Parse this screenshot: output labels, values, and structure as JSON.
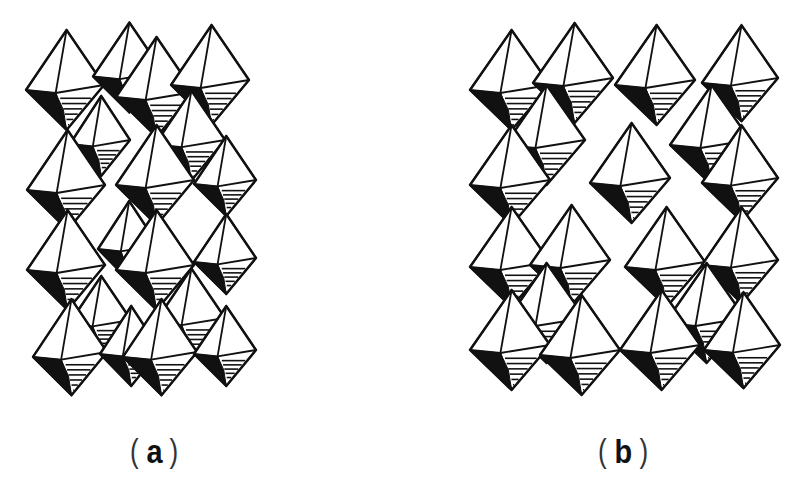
{
  "figure": {
    "background": "#ffffff",
    "ink": "#111111",
    "panels": [
      {
        "id": "a",
        "label": "a",
        "paren_open": "(",
        "paren_close": ")",
        "label_x": 130,
        "description": "Densely packed corner/edge-sharing octahedra",
        "octahedra": [
          {
            "cx": 65,
            "cy": 85,
            "w": 78,
            "h": 100
          },
          {
            "cx": 128,
            "cy": 72,
            "w": 70,
            "h": 90
          },
          {
            "cx": 155,
            "cy": 92,
            "w": 78,
            "h": 100
          },
          {
            "cx": 210,
            "cy": 80,
            "w": 78,
            "h": 100
          },
          {
            "cx": 100,
            "cy": 140,
            "w": 60,
            "h": 80
          },
          {
            "cx": 190,
            "cy": 140,
            "w": 70,
            "h": 90
          },
          {
            "cx": 66,
            "cy": 185,
            "w": 78,
            "h": 100
          },
          {
            "cx": 155,
            "cy": 180,
            "w": 78,
            "h": 100
          },
          {
            "cx": 225,
            "cy": 180,
            "w": 62,
            "h": 80
          },
          {
            "cx": 66,
            "cy": 265,
            "w": 78,
            "h": 100
          },
          {
            "cx": 128,
            "cy": 245,
            "w": 60,
            "h": 80
          },
          {
            "cx": 155,
            "cy": 265,
            "w": 78,
            "h": 100
          },
          {
            "cx": 225,
            "cy": 258,
            "w": 62,
            "h": 80
          },
          {
            "cx": 100,
            "cy": 320,
            "w": 62,
            "h": 80
          },
          {
            "cx": 190,
            "cy": 318,
            "w": 70,
            "h": 90
          },
          {
            "cx": 70,
            "cy": 352,
            "w": 74,
            "h": 96
          },
          {
            "cx": 130,
            "cy": 350,
            "w": 60,
            "h": 80
          },
          {
            "cx": 160,
            "cy": 352,
            "w": 74,
            "h": 96
          },
          {
            "cx": 225,
            "cy": 350,
            "w": 62,
            "h": 80
          }
        ]
      },
      {
        "id": "b",
        "label": "b",
        "paren_open": "(",
        "paren_close": ")",
        "label_x": 598,
        "description": "Octahedra arranged with open channels (vacancies)",
        "octahedra": [
          {
            "cx": 510,
            "cy": 85,
            "w": 80,
            "h": 100
          },
          {
            "cx": 573,
            "cy": 78,
            "w": 80,
            "h": 100
          },
          {
            "cx": 655,
            "cy": 80,
            "w": 80,
            "h": 100
          },
          {
            "cx": 740,
            "cy": 78,
            "w": 76,
            "h": 96
          },
          {
            "cx": 545,
            "cy": 140,
            "w": 80,
            "h": 100
          },
          {
            "cx": 710,
            "cy": 140,
            "w": 80,
            "h": 100
          },
          {
            "cx": 510,
            "cy": 180,
            "w": 80,
            "h": 100
          },
          {
            "cx": 630,
            "cy": 178,
            "w": 80,
            "h": 100
          },
          {
            "cx": 740,
            "cy": 178,
            "w": 76,
            "h": 96
          },
          {
            "cx": 510,
            "cy": 262,
            "w": 80,
            "h": 100
          },
          {
            "cx": 570,
            "cy": 260,
            "w": 80,
            "h": 100
          },
          {
            "cx": 665,
            "cy": 262,
            "w": 80,
            "h": 100
          },
          {
            "cx": 740,
            "cy": 260,
            "w": 76,
            "h": 96
          },
          {
            "cx": 545,
            "cy": 318,
            "w": 80,
            "h": 100
          },
          {
            "cx": 705,
            "cy": 318,
            "w": 80,
            "h": 100
          },
          {
            "cx": 510,
            "cy": 345,
            "w": 80,
            "h": 100
          },
          {
            "cx": 580,
            "cy": 350,
            "w": 80,
            "h": 100
          },
          {
            "cx": 660,
            "cy": 345,
            "w": 80,
            "h": 100
          },
          {
            "cx": 742,
            "cy": 345,
            "w": 76,
            "h": 96
          }
        ]
      }
    ]
  }
}
